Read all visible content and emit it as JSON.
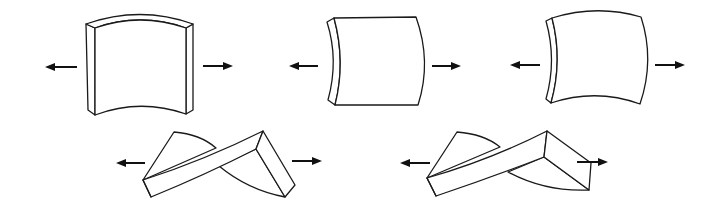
{
  "diagram": {
    "title": "",
    "colors": {
      "stroke": "#1a1a1a",
      "arrow": "#111111",
      "background": "#ffffff"
    },
    "figures": [
      {
        "id": "bent-block",
        "row": 1,
        "deformation": "bending (curved top and bottom faces)",
        "forces": [
          "left-arrow",
          "right-arrow"
        ]
      },
      {
        "id": "curved-side-block",
        "row": 1,
        "deformation": "bending (curved side faces)",
        "forces": [
          "left-arrow",
          "right-arrow"
        ]
      },
      {
        "id": "warped-block",
        "row": 1,
        "deformation": "combined bending (all faces curved)",
        "forces": [
          "left-arrow",
          "right-arrow"
        ]
      },
      {
        "id": "twisted-strip-1",
        "row": 2,
        "deformation": "twisting",
        "forces": [
          "left-arrow",
          "right-arrow"
        ]
      },
      {
        "id": "twisted-strip-2",
        "row": 2,
        "deformation": "twisting with end rotation",
        "forces": [
          "left-arrow",
          "right-arrow"
        ]
      }
    ]
  }
}
